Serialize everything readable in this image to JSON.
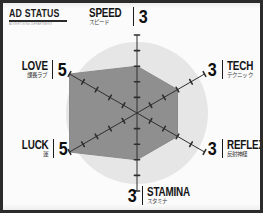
{
  "header": {
    "title": "AD STATUS",
    "subtitle": "ADVERTISING DEPARTMENT"
  },
  "chart_data": {
    "type": "radar",
    "title": "AD STATUS",
    "max": 5,
    "min": 0,
    "rings": 5,
    "categories": [
      "SPEED",
      "TECH",
      "REFLEX",
      "STAMINA",
      "LUCK",
      "LOVE"
    ],
    "categories_jp": [
      "スピード",
      "テクニック",
      "反射神経",
      "スタミナ",
      "運",
      "課長ラブ"
    ],
    "values": [
      3,
      3,
      3,
      3,
      5,
      5
    ],
    "series": [
      {
        "name": "AD STATUS",
        "values": [
          3,
          3,
          3,
          3,
          5,
          5
        ]
      }
    ],
    "axis_order": "clockwise-from-top",
    "grid": "radial-ticks",
    "legend": "none",
    "fill_color": "#8f8f8f",
    "backdrop_color": "#e6e6e6",
    "axis_color": "#2e2e2e"
  },
  "stats": [
    {
      "id": "speed",
      "name_en": "SPEED",
      "name_jp": "スピード",
      "value": "3",
      "side": "right"
    },
    {
      "id": "tech",
      "name_en": "TECH",
      "name_jp": "テクニック",
      "value": "3",
      "side": "right"
    },
    {
      "id": "reflex",
      "name_en": "REFLEX",
      "name_jp": "反射神経",
      "value": "3",
      "side": "right"
    },
    {
      "id": "stamina",
      "name_en": "STAMINA",
      "name_jp": "スタミナ",
      "value": "3",
      "side": "right"
    },
    {
      "id": "luck",
      "name_en": "LUCK",
      "name_jp": "運",
      "value": "5",
      "side": "left"
    },
    {
      "id": "love",
      "name_en": "LOVE",
      "name_jp": "課長ラブ",
      "value": "5",
      "side": "left"
    }
  ],
  "colors": {
    "frame": "#2b2b2b",
    "paper": "#fbfbfb",
    "polygon_fill": "#8f8f8f",
    "circle_backdrop": "#e6e6e6",
    "ink": "#141414"
  }
}
